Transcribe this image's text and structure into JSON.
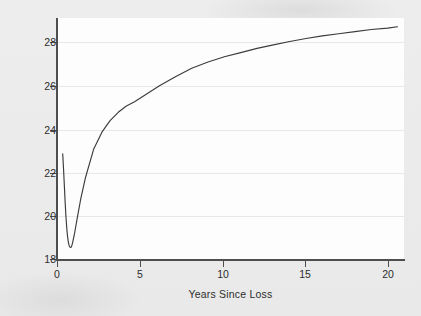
{
  "chart_data": {
    "type": "line",
    "title": "",
    "xlabel": "Years Since Loss",
    "ylabel": "Personal Growth",
    "xlim": [
      -0.25,
      21.0
    ],
    "ylim": [
      17.55,
      29.1
    ],
    "xticks": [
      0,
      5,
      10,
      15,
      20
    ],
    "yticks": [
      18,
      20,
      22,
      24,
      26,
      28
    ],
    "xtick_labels": [
      "0",
      "5",
      "10",
      "15",
      "20"
    ],
    "ytick_labels": [
      "18",
      "20",
      "22",
      "24",
      "26",
      "28"
    ],
    "grid": "horizontal",
    "legend": "none",
    "line_color": "#3c3c3c",
    "background_color": "#ebebeb",
    "plot_background_color": "#fdfdfd",
    "series": [
      {
        "name": "Personal Growth",
        "x": [
          0.1,
          0.15,
          0.2,
          0.25,
          0.3,
          0.35,
          0.4,
          0.45,
          0.5,
          0.55,
          0.6,
          0.65,
          0.7,
          0.8,
          0.9,
          1.0,
          1.2,
          1.5,
          2.0,
          2.5,
          3.0,
          3.5,
          4.0,
          4.5,
          5.0,
          6.0,
          7.0,
          8.0,
          9.0,
          10.0,
          11.0,
          12.0,
          13.0,
          14.0,
          15.0,
          16.0,
          17.0,
          18.0,
          19.0,
          20.0,
          20.6
        ],
        "y": [
          22.62,
          21.9,
          21.1,
          20.3,
          19.6,
          19.05,
          18.65,
          18.38,
          18.22,
          18.16,
          18.15,
          18.22,
          18.35,
          18.72,
          19.15,
          19.6,
          20.45,
          21.5,
          22.85,
          23.65,
          24.2,
          24.6,
          24.9,
          25.1,
          25.35,
          25.85,
          26.3,
          26.7,
          27.0,
          27.25,
          27.45,
          27.65,
          27.82,
          27.98,
          28.12,
          28.25,
          28.35,
          28.45,
          28.55,
          28.62,
          28.68
        ]
      }
    ],
    "annotations": []
  },
  "axes": {
    "y_title": "Personal Growth",
    "x_title": "Years Since Loss"
  }
}
